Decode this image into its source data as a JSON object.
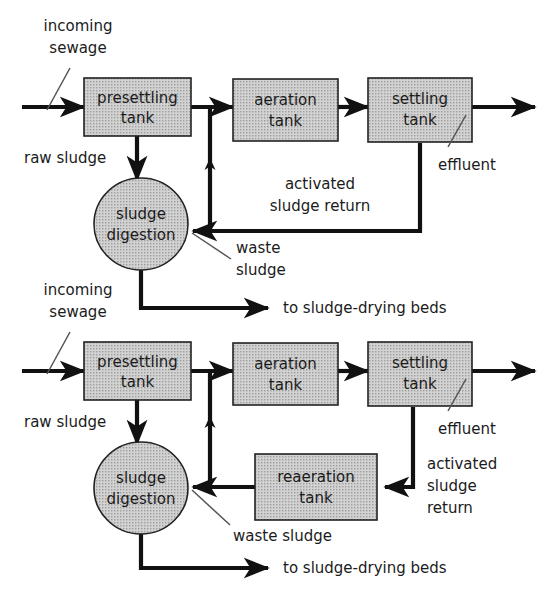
{
  "figure": {
    "colors": {
      "tank_fill": "#c6c6c6",
      "tank_stroke": "#222222",
      "line": "#111111",
      "leader_line": "#555555",
      "text": "#1b1b1b",
      "background": "#ffffff"
    }
  },
  "diagrams": [
    {
      "id": "conventional-activated-sludge",
      "nodes": [
        {
          "id": "presettling-tank",
          "shape": "rect",
          "label_line1": "presettling",
          "label_line2": "tank"
        },
        {
          "id": "aeration-tank",
          "shape": "rect",
          "label_line1": "aeration",
          "label_line2": "tank"
        },
        {
          "id": "settling-tank",
          "shape": "rect",
          "label_line1": "settling",
          "label_line2": "tank"
        },
        {
          "id": "sludge-digestion",
          "shape": "circle",
          "label_line1": "sludge",
          "label_line2": "digestion"
        }
      ],
      "annotations": [
        {
          "id": "incoming-sewage",
          "line1": "incoming",
          "line2": "sewage"
        },
        {
          "id": "raw-sludge",
          "line1": "raw sludge"
        },
        {
          "id": "effluent",
          "line1": "effluent"
        },
        {
          "id": "activated-sludge-return",
          "line1": "activated",
          "line2": "sludge return"
        },
        {
          "id": "waste-sludge",
          "line1": "waste",
          "line2": "sludge"
        },
        {
          "id": "to-sludge-drying-beds",
          "line1": "to sludge-drying beds"
        }
      ]
    },
    {
      "id": "contact-stabilization-activated-sludge",
      "nodes": [
        {
          "id": "presettling-tank-2",
          "shape": "rect",
          "label_line1": "presettling",
          "label_line2": "tank"
        },
        {
          "id": "aeration-tank-2",
          "shape": "rect",
          "label_line1": "aeration",
          "label_line2": "tank"
        },
        {
          "id": "settling-tank-2",
          "shape": "rect",
          "label_line1": "settling",
          "label_line2": "tank"
        },
        {
          "id": "reaeration-tank",
          "shape": "rect",
          "label_line1": "reaeration",
          "label_line2": "tank"
        },
        {
          "id": "sludge-digestion-2",
          "shape": "circle",
          "label_line1": "sludge",
          "label_line2": "digestion"
        }
      ],
      "annotations": [
        {
          "id": "incoming-sewage-2",
          "line1": "incoming",
          "line2": "sewage"
        },
        {
          "id": "raw-sludge-2",
          "line1": "raw sludge"
        },
        {
          "id": "effluent-2",
          "line1": "effluent"
        },
        {
          "id": "activated-sludge-return-2",
          "line1": "activated",
          "line2": "sludge",
          "line3": "return"
        },
        {
          "id": "waste-sludge-2",
          "line1": "waste sludge"
        },
        {
          "id": "to-sludge-drying-beds-2",
          "line1": "to sludge-drying beds"
        }
      ]
    }
  ],
  "text": {
    "presettling_l1": "presettling",
    "presettling_l2": "tank",
    "aeration_l1": "aeration",
    "aeration_l2": "tank",
    "settling_l1": "settling",
    "settling_l2": "tank",
    "reaeration_l1": "reaeration",
    "reaeration_l2": "tank",
    "digestion_l1": "sludge",
    "digestion_l2": "digestion",
    "incoming_l1": "incoming",
    "incoming_l2": "sewage",
    "raw_sludge": "raw sludge",
    "effluent": "effluent",
    "asr_l1": "activated",
    "asr_l2": "sludge return",
    "asr2_l1": "activated",
    "asr2_l2": "sludge",
    "asr2_l3": "return",
    "waste_l1": "waste",
    "waste_l2": "sludge",
    "waste_one_line": "waste sludge",
    "drying_beds": "to sludge-drying beds"
  }
}
